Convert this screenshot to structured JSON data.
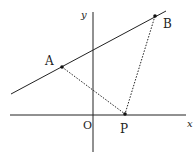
{
  "diagram": {
    "axes": {
      "x_label": "x",
      "y_label": "y",
      "origin_label": "O"
    },
    "points": {
      "A": {
        "label": "A"
      },
      "B": {
        "label": "B"
      },
      "P": {
        "label": "P"
      }
    },
    "colors": {
      "stroke": "#222222",
      "background": "#ffffff"
    }
  }
}
